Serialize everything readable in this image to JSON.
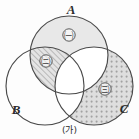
{
  "figure": {
    "caption": "(가)",
    "background_color": "#fdfdfd",
    "stroke_color": "#4a4a4a"
  },
  "sets": [
    {
      "id": "A",
      "label": "A",
      "position": "top",
      "fill_style": "light-gray",
      "fill_color": "#e8e8e8",
      "cx": 69,
      "cy": 55,
      "r": 39
    },
    {
      "id": "B",
      "label": "B",
      "position": "bottom-left",
      "fill_style": "none",
      "fill_color": "#ffffff",
      "cx": 45,
      "cy": 86,
      "r": 39
    },
    {
      "id": "C",
      "label": "C",
      "position": "bottom-right",
      "fill_style": "dotted",
      "fill_color": "#d8d8d8",
      "cx": 94,
      "cy": 86,
      "r": 39
    }
  ],
  "regions": [
    {
      "mark": "㈠",
      "description": "A only",
      "fill_style": "light-gray",
      "x": 69,
      "y": 38
    },
    {
      "mark": "㈡",
      "description": "A intersect B minus C",
      "fill_style": "diagonal-hatch",
      "x": 46,
      "y": 64
    },
    {
      "mark": "㈢",
      "description": "C minus A minus B",
      "fill_style": "dotted",
      "x": 105,
      "y": 92
    }
  ],
  "labels": {
    "a": {
      "text": "A",
      "x": 71,
      "y": 14
    },
    "b": {
      "text": "B",
      "x": 16,
      "y": 114
    },
    "c": {
      "text": "C",
      "x": 124,
      "y": 113
    }
  }
}
